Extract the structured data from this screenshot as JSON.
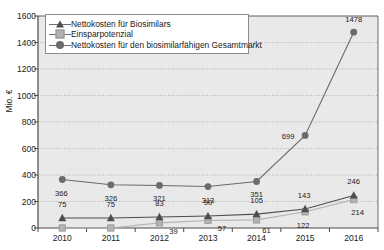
{
  "chart_data": {
    "type": "line",
    "title": "",
    "xlabel": "",
    "ylabel": "Mio. €",
    "categories": [
      "2010",
      "2011",
      "2012",
      "2013",
      "2014",
      "2015",
      "2016"
    ],
    "ylim": [
      0,
      1600
    ],
    "ytick_values": [
      0,
      200,
      400,
      600,
      800,
      1000,
      1200,
      1400,
      1600
    ],
    "ytick_labels": [
      "0",
      "200",
      "400",
      "600",
      "800",
      "1000",
      "1200",
      "1400",
      "1600"
    ],
    "grid": true,
    "legend_position": "top-left",
    "series": [
      {
        "name": "Nettokosten für Biosimilars",
        "marker": "triangle",
        "color": "#4d4d4d",
        "values": [
          75,
          75,
          83,
          90,
          105,
          143,
          246
        ],
        "labels": [
          "75",
          "75",
          "83",
          "90",
          "105",
          "143",
          "246"
        ]
      },
      {
        "name": "Einsparpotenzial",
        "marker": "square",
        "color": "#b3b3b3",
        "values": [
          0,
          0,
          39,
          57,
          61,
          122,
          214
        ],
        "labels": [
          "",
          "",
          "39",
          "57",
          "61",
          "122",
          "214"
        ]
      },
      {
        "name": "Nettokosten für den biosimilarfähigen Gesamtmarkt",
        "marker": "circle",
        "color": "#6b6b6b",
        "values": [
          366,
          326,
          321,
          313,
          351,
          699,
          1478
        ],
        "labels": [
          "366",
          "326",
          "321",
          "313",
          "351",
          "699",
          "1478"
        ]
      }
    ]
  },
  "colors": {
    "plot_background": "#e9e9e9",
    "grid": "#9a9a9a",
    "axis": "#4a4a4a",
    "text": "#1a1a1a"
  }
}
